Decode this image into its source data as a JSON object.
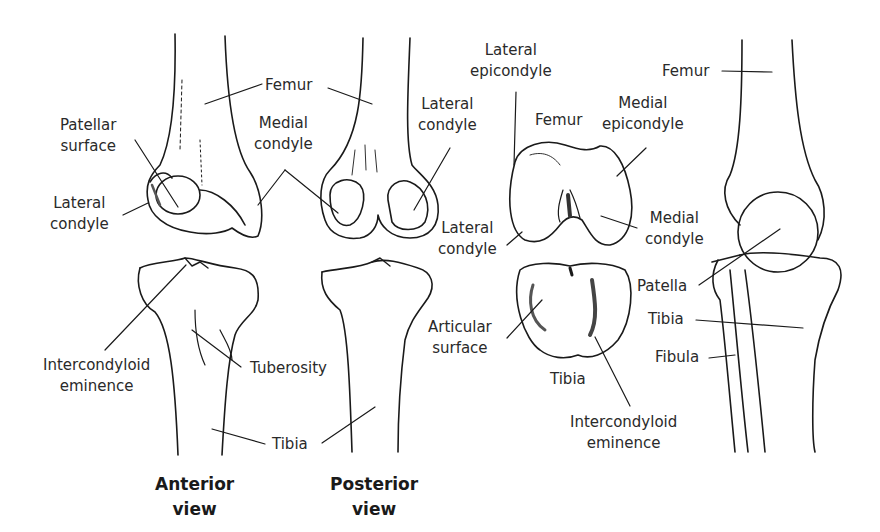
{
  "figure": {
    "captions": {
      "anterior": [
        "Anterior",
        "view"
      ],
      "posterior": [
        "Posterior",
        "view"
      ]
    },
    "labels": {
      "femur_ant_post": "Femur",
      "patellar_surface": [
        "Patellar",
        "surface"
      ],
      "lateral_condyle_ant": [
        "Lateral",
        "condyle"
      ],
      "medial_condyle_post": [
        "Medial",
        "condyle"
      ],
      "lateral_condyle_post": [
        "Lateral",
        "condyle"
      ],
      "lateral_epicondyle": [
        "Lateral",
        "epicondyle"
      ],
      "femur_inferior": "Femur",
      "medial_epicondyle": [
        "Medial",
        "epicondyle"
      ],
      "lateral_condyle_inf": [
        "Lateral",
        "condyle"
      ],
      "medial_condyle_inf": [
        "Medial",
        "condyle"
      ],
      "femur_lateral": "Femur",
      "patella": "Patella",
      "tibia_lateral": "Tibia",
      "fibula": "Fibula",
      "intercondyloid_eminence_ant": [
        "Intercondyloid",
        "eminence"
      ],
      "tuberosity": "Tuberosity",
      "tibia_ant_post": "Tibia",
      "articular_surface": [
        "Articular",
        "surface"
      ],
      "tibia_superior": "Tibia",
      "intercondyloid_eminence_sup": [
        "Intercondyloid",
        "eminence"
      ]
    }
  }
}
